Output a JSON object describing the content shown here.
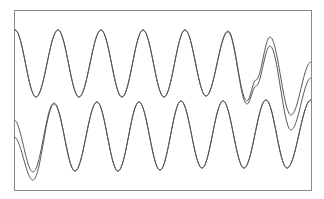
{
  "chart_data": {
    "type": "line",
    "title": "",
    "xlabel": "",
    "ylabel": "",
    "grid": false,
    "legend": null,
    "axes_ticks": "none",
    "plot_frame_px": {
      "x0": 14,
      "y0": 10,
      "x1": 311,
      "y1": 190
    },
    "colors": {
      "frame": "#8a8a8a",
      "line": "#555555",
      "background": "#ffffff"
    },
    "series": [
      {
        "name": "upper-a",
        "group": "upper",
        "x_px": [
          14,
          15,
          36,
          58,
          79,
          101,
          122,
          143,
          164,
          185,
          206,
          228,
          247,
          256,
          270,
          291,
          311
        ],
        "y_px": [
          31,
          30,
          97,
          30,
          97,
          30,
          97,
          30,
          97,
          30,
          96,
          31,
          101,
          80,
          37,
          115,
          62
        ]
      },
      {
        "name": "upper-b",
        "group": "upper",
        "x_px": [
          14,
          15,
          36,
          58,
          79,
          101,
          122,
          143,
          164,
          185,
          206,
          228,
          247,
          256,
          270,
          291,
          311
        ],
        "y_px": [
          31,
          30,
          97,
          30,
          97,
          30,
          97,
          30,
          97,
          30,
          96,
          32,
          104,
          86,
          46,
          130,
          78
        ]
      },
      {
        "name": "lower-a",
        "group": "lower",
        "x_px": [
          14,
          33,
          54,
          75,
          97,
          118,
          139,
          160,
          181,
          202,
          223,
          244,
          266,
          287,
          311
        ],
        "y_px": [
          120,
          172,
          103,
          171,
          102,
          171,
          102,
          170,
          101,
          168,
          101,
          168,
          100,
          168,
          100
        ]
      },
      {
        "name": "lower-b",
        "group": "lower",
        "x_px": [
          14,
          33,
          54,
          75,
          97,
          118,
          139,
          160,
          181,
          202,
          223,
          244,
          266,
          287,
          311
        ],
        "y_px": [
          137,
          180,
          104,
          171,
          102,
          171,
          102,
          170,
          101,
          168,
          101,
          168,
          100,
          168,
          100
        ]
      }
    ]
  }
}
